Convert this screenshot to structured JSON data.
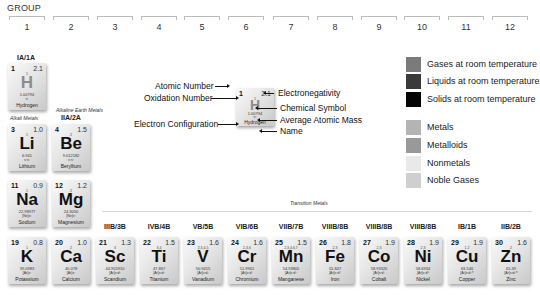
{
  "header": {
    "title": "GROUP"
  },
  "columns": [
    "1",
    "2",
    "3",
    "4",
    "5",
    "6",
    "7",
    "8",
    "9",
    "10",
    "11",
    "12"
  ],
  "group_labels": {
    "g1": "IA/1A",
    "g2": "IIA/2A",
    "g3": "IIIB/3B",
    "g4": "IVB/4B",
    "g5": "VB/5B",
    "g6": "VIB/6B",
    "g7": "VIIB/7B",
    "g8": "VIIIB/8B",
    "g9": "VIIIB/8B",
    "g10": "VIIIB/8B",
    "g11": "IB/1B",
    "g12": "IIB/2B"
  },
  "series_labels": {
    "alkali": "Alkali Metals",
    "alkaline_earth": "Alkaline Earth Metals",
    "transition": "Transition Metals"
  },
  "key": {
    "atomic_number_label": "Atomic Number",
    "oxidation_label": "Oxidation Number",
    "electron_config_label": "Electron Configuration",
    "electronegativity_label": "Electronegativity",
    "symbol_label": "Chemical Symbol",
    "mass_label": "Average Atomic Mass",
    "name_label": "Name",
    "tile": {
      "z": "1",
      "en": "2.1",
      "ox": "1",
      "sym": "H",
      "mass": "1.00794",
      "cfg": "s¹",
      "name": "Hydrogen"
    }
  },
  "legend": {
    "state": [
      {
        "label": "Gases at room temperature",
        "color": "#7b7b7b"
      },
      {
        "label": "Liquids at room temperature",
        "color": "#3a3a3a"
      },
      {
        "label": "Solids at room temperature",
        "color": "#050505"
      }
    ],
    "category": [
      {
        "label": "Metals",
        "color": "#b4b4b4"
      },
      {
        "label": "Metalloids",
        "color": "#999999"
      },
      {
        "label": "Nonmetals",
        "color": "#e9e9e9"
      },
      {
        "label": "Noble Gases",
        "color": "#cfcfcf"
      }
    ]
  },
  "elements": {
    "H": {
      "z": "1",
      "en": "2.1",
      "ox": "1",
      "sym": "H",
      "mass": "1.00794",
      "cfg": "s¹",
      "name": "Hydrogen"
    },
    "Li": {
      "z": "3",
      "en": "1.0",
      "ox": "1",
      "sym": "Li",
      "mass": "6.941",
      "cfg": "s²s¹",
      "name": "Lithium"
    },
    "Be": {
      "z": "4",
      "en": "1.5",
      "ox": "2",
      "sym": "Be",
      "mass": "9.012182",
      "cfg": "s²s²",
      "name": "Beryllium"
    },
    "Na": {
      "z": "11",
      "en": "0.9",
      "ox": "1",
      "sym": "Na",
      "mass": "22.98977",
      "cfg": "[Ne]s¹",
      "name": "Sodium"
    },
    "Mg": {
      "z": "12",
      "en": "1.2",
      "ox": "2",
      "sym": "Mg",
      "mass": "24.3050",
      "cfg": "[Ne]s²",
      "name": "Magnesium"
    },
    "K": {
      "z": "19",
      "en": "0.8",
      "ox": "1",
      "sym": "K",
      "mass": "39.0983",
      "cfg": "[Ar]s¹",
      "name": "Potassium"
    },
    "Ca": {
      "z": "20",
      "en": "1.0",
      "ox": "2",
      "sym": "Ca",
      "mass": "40.078",
      "cfg": "[Ar]s²",
      "name": "Calcium"
    },
    "Sc": {
      "z": "21",
      "en": "1.3",
      "ox": "3",
      "sym": "Sc",
      "mass": "44.955910",
      "cfg": "[Ar]s²d¹",
      "name": "Scandium"
    },
    "Ti": {
      "z": "22",
      "en": "1.5",
      "ox": "3,4",
      "sym": "Ti",
      "mass": "47.867",
      "cfg": "[Ar]s²d²",
      "name": "Titanium"
    },
    "V": {
      "z": "23",
      "en": "1.6",
      "ox": "2,3,4,5",
      "sym": "V",
      "mass": "50.9415",
      "cfg": "[Ar]s²d³",
      "name": "Vanadium"
    },
    "Cr": {
      "z": "24",
      "en": "1.6",
      "ox": "2,3,6",
      "sym": "Cr",
      "mass": "51.9961",
      "cfg": "[Ar]s¹d⁵",
      "name": "Chromium"
    },
    "Mn": {
      "z": "25",
      "en": "1.5",
      "ox": "2,3,4,6,7",
      "sym": "Mn",
      "mass": "54.93805",
      "cfg": "[Ar]s²d⁵",
      "name": "Manganese"
    },
    "Fe": {
      "z": "26",
      "en": "1.8",
      "ox": "2,3",
      "sym": "Fe",
      "mass": "55.847",
      "cfg": "[Ar]s²d⁶",
      "name": "Iron"
    },
    "Co": {
      "z": "27",
      "en": "1.9",
      "ox": "2,3",
      "sym": "Co",
      "mass": "58.93320",
      "cfg": "[Ar]s²d⁷",
      "name": "Cobalt"
    },
    "Ni": {
      "z": "28",
      "en": "1.9",
      "ox": "2,3",
      "sym": "Ni",
      "mass": "58.6934",
      "cfg": "[Ar]s²d⁸",
      "name": "Nickel"
    },
    "Cu": {
      "z": "29",
      "en": "1.9",
      "ox": "1,2",
      "sym": "Cu",
      "mass": "63.546",
      "cfg": "[Ar]s¹d¹⁰",
      "name": "Copper"
    },
    "Zn": {
      "z": "30",
      "en": "1.6",
      "ox": "2",
      "sym": "Zn",
      "mass": "65.39",
      "cfg": "[Ar]s²d¹⁰",
      "name": "Zinc"
    }
  }
}
